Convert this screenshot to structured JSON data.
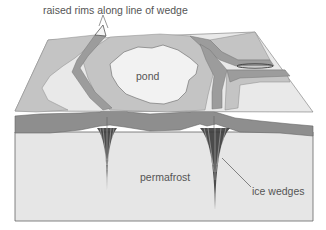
{
  "figure": {
    "type": "block diagram"
  },
  "labels": {
    "top": "raised rims along line of wedge",
    "pond": "pond",
    "permafrost": "permafrost",
    "ice_wedges": "ice wedges"
  },
  "colors": {
    "background": "#ffffff",
    "surface_light": "#e9e9e9",
    "surface_mid": "#c4c4c4",
    "trough": "#9c9c9c",
    "active_layer": "#8e8e8e",
    "permafrost": "#e6e6e6",
    "pond": "#f2f2f2",
    "wedge": "#2a2a2a",
    "outline": "#666666",
    "text": "#555555"
  }
}
